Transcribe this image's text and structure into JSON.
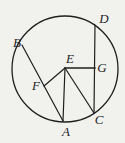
{
  "diagram": {
    "name": "circle-with-chords-figure",
    "background": "#f1f1ee",
    "ink": "#1f1f1f",
    "circle": {
      "cx": 65,
      "cy": 69,
      "r": 53,
      "stroke_width": 1.3
    },
    "points": {
      "A": {
        "x": 63,
        "y": 121
      },
      "B": {
        "x": 22,
        "y": 45
      },
      "C": {
        "x": 94,
        "y": 113
      },
      "D": {
        "x": 95,
        "y": 25
      },
      "E": {
        "x": 65,
        "y": 68
      },
      "F": {
        "x": 44,
        "y": 86
      },
      "G": {
        "x": 95,
        "y": 68
      }
    },
    "segments": [
      {
        "from": "B",
        "to": "A",
        "width": 1.2
      },
      {
        "from": "D",
        "to": "C",
        "width": 1.2
      },
      {
        "from": "E",
        "to": "F",
        "width": 1.2
      },
      {
        "from": "E",
        "to": "A",
        "width": 1.2
      },
      {
        "from": "E",
        "to": "C",
        "width": 1.2
      },
      {
        "from": "E",
        "to": "G",
        "width": 1.7
      }
    ],
    "labels": [
      {
        "text": "B",
        "x": 17,
        "y": 47
      },
      {
        "text": "D",
        "x": 104,
        "y": 23
      },
      {
        "text": "E",
        "x": 70,
        "y": 63
      },
      {
        "text": "G",
        "x": 102,
        "y": 72
      },
      {
        "text": "F",
        "x": 36,
        "y": 90
      },
      {
        "text": "A",
        "x": 66,
        "y": 136
      },
      {
        "text": "C",
        "x": 99,
        "y": 124
      }
    ]
  }
}
